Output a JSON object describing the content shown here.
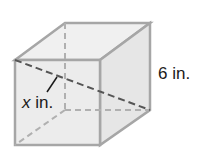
{
  "diagram": {
    "shape": "cube",
    "labels": {
      "edge": "6 in.",
      "diagonal_var": "x",
      "diagonal_unit": " in."
    },
    "colors": {
      "edge": "#a6a6a6",
      "face": "#ececec",
      "dashed": "#555555",
      "text": "#1a1a1a"
    }
  }
}
